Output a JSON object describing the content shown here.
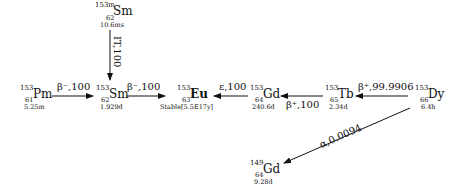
{
  "diagram": {
    "type": "nuclear-decay-chain",
    "nuclides": [
      {
        "id": "sm153m",
        "mass": "153m",
        "symbol": "Sm",
        "z": "62",
        "halflife": "10.6ms"
      },
      {
        "id": "pm153",
        "mass": "153",
        "symbol": "Pm",
        "z": "61",
        "halflife": "5.25m"
      },
      {
        "id": "sm153",
        "mass": "153",
        "symbol": "Sm",
        "z": "62",
        "halflife": "1.929d"
      },
      {
        "id": "eu153",
        "mass": "153",
        "symbol": "Eu",
        "z": "63",
        "halflife": "Stable[5.5E17y]"
      },
      {
        "id": "gd153",
        "mass": "153",
        "symbol": "Gd",
        "z": "64",
        "halflife": "240.6d"
      },
      {
        "id": "tb153",
        "mass": "153",
        "symbol": "Tb",
        "z": "65",
        "halflife": "2.34d"
      },
      {
        "id": "dy153",
        "mass": "153",
        "symbol": "Dy",
        "z": "66",
        "halflife": "6.4h"
      },
      {
        "id": "gd149",
        "mass": "149",
        "symbol": "Gd",
        "z": "64",
        "halflife": "9.28d"
      }
    ],
    "decays": [
      {
        "from": "sm153m",
        "to": "sm153",
        "label": "IT,100"
      },
      {
        "from": "pm153",
        "to": "sm153",
        "label": "β⁻,100"
      },
      {
        "from": "sm153",
        "to": "eu153",
        "label": "β⁻,100"
      },
      {
        "from": "gd153",
        "to": "eu153",
        "label": "ε,100"
      },
      {
        "from": "tb153",
        "to": "gd153",
        "label": "β⁺,100"
      },
      {
        "from": "dy153",
        "to": "tb153",
        "label": "β⁺,99.9906"
      },
      {
        "from": "dy153",
        "to": "gd149",
        "label": "α,0.0094"
      }
    ]
  }
}
